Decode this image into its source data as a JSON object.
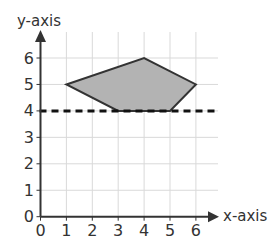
{
  "chart_data": {
    "type": "polygon-on-grid",
    "xlabel": "x-axis",
    "ylabel": "y-axis",
    "xlim": [
      0,
      6
    ],
    "ylim": [
      0,
      6
    ],
    "x_ticks": [
      "0",
      "1",
      "2",
      "3",
      "4",
      "5",
      "6"
    ],
    "y_ticks": [
      "0",
      "1",
      "2",
      "3",
      "4",
      "5",
      "6"
    ],
    "grid": true,
    "polygon": {
      "vertices": [
        [
          1,
          5
        ],
        [
          4,
          6
        ],
        [
          6,
          5
        ],
        [
          5,
          4
        ],
        [
          3,
          4
        ]
      ],
      "fill": "#b3b3b3",
      "stroke": "#333333"
    },
    "dashed_line": {
      "y": 4,
      "x_from": 0,
      "x_to": 6.85,
      "color": "#111111"
    }
  },
  "colors": {
    "axis": "#333333",
    "grid": "#d9d9d9",
    "text": "#333333"
  }
}
